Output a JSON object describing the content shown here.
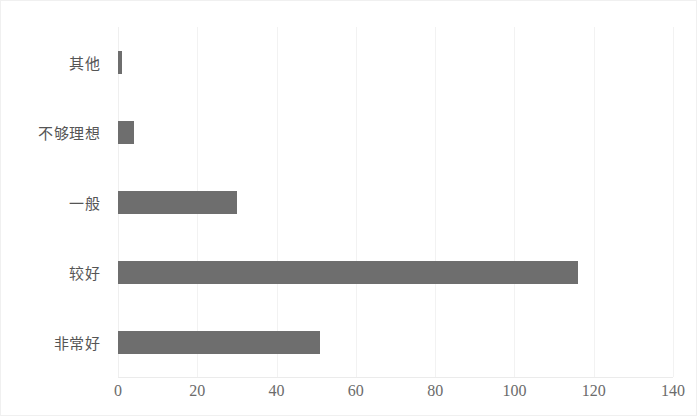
{
  "chart_data": {
    "type": "bar",
    "orientation": "horizontal",
    "title": "",
    "subtitle": "",
    "xlabel": "",
    "ylabel": "",
    "categories": [
      "其他",
      "不够理想",
      "一般",
      "较好",
      "非常好"
    ],
    "values": [
      1,
      4,
      30,
      116,
      51
    ],
    "series": [
      {
        "name": "",
        "values": [
          1,
          4,
          30,
          116,
          51
        ]
      }
    ],
    "xlim": [
      0,
      140
    ],
    "xticks": [
      0,
      20,
      40,
      60,
      80,
      100,
      120,
      140
    ],
    "xtick_labels": [
      "0",
      "20",
      "40",
      "60",
      "80",
      "100",
      "120",
      "140"
    ],
    "grid": true,
    "grid_axis": "x",
    "legend": false,
    "legend_position": "none",
    "annotations": [],
    "colors": {
      "bar": "#6e6e6e",
      "gridline": "#f2f2f2",
      "category_label": "#555555",
      "tick_label": "#6b6b6b",
      "background": "#ffffff",
      "frame_border": "#f0f0f0"
    }
  }
}
